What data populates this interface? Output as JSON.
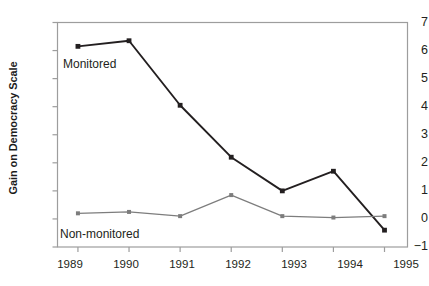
{
  "chart_data": {
    "type": "line",
    "title": "",
    "xlabel": "",
    "ylabel": "Gain on Democracy Scale",
    "categories": [
      "1989",
      "1990",
      "1991",
      "1992",
      "1993",
      "1994",
      "1995"
    ],
    "x": [
      1989,
      1990,
      1991,
      1992,
      1993,
      1994,
      1995
    ],
    "xlim": [
      1988.6,
      1995.45
    ],
    "ylim": [
      -1,
      7
    ],
    "yticks": [
      7,
      6,
      5,
      4,
      3,
      2,
      1,
      0,
      -1
    ],
    "ytick_labels": [
      "7",
      "6",
      "5",
      "4",
      "3",
      "2",
      "1",
      "0",
      "−1"
    ],
    "grid": false,
    "legend_position": "inline-annotations",
    "series": [
      {
        "name": "Monitored",
        "color": "#231f20",
        "marker": "square",
        "values": [
          6.15,
          6.35,
          4.05,
          2.2,
          1.0,
          1.7,
          -0.4
        ]
      },
      {
        "name": "Non-monitored",
        "color": "#7d7d7d",
        "marker": "square",
        "values": [
          0.2,
          0.25,
          0.1,
          0.85,
          0.1,
          0.05,
          0.1
        ]
      }
    ],
    "annotations": [
      {
        "text": "Monitored",
        "series": "Monitored"
      },
      {
        "text": "Non-monitored",
        "series": "Non-monitored"
      }
    ]
  },
  "axes": {
    "y_title": "Gain on Democracy Scale",
    "y_tick_labels": [
      "7",
      "6",
      "5",
      "4",
      "3",
      "2",
      "1",
      "0",
      "−1"
    ],
    "x_tick_labels": [
      "1989",
      "1990",
      "1991",
      "1992",
      "1993",
      "1994",
      "1995"
    ]
  },
  "labels": {
    "monitored": "Monitored",
    "non_monitored": "Non-monitored"
  },
  "colors": {
    "monitored": "#231f20",
    "non_monitored": "#7d7d7d",
    "frame": "#9d9d9d",
    "text": "#231f20"
  }
}
